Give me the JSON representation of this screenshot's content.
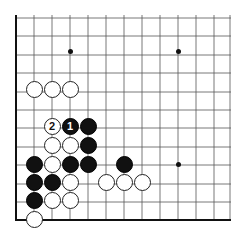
{
  "diagram": {
    "type": "go-board-corner",
    "colors": {
      "line": "#555555",
      "edge": "#111111",
      "black": "#111111",
      "white": "#ffffff"
    },
    "grid": {
      "x_lines": [
        16,
        34,
        52,
        70,
        88,
        106,
        124,
        142,
        160,
        178,
        196,
        214,
        230
      ],
      "y_lines": [
        18,
        36,
        55,
        73,
        92,
        110,
        128,
        147,
        165,
        184,
        202,
        220
      ],
      "left_edge_x": 16,
      "bottom_edge_y": 220,
      "top_y": 15,
      "right_x": 231
    },
    "star_points": [
      {
        "x": 70,
        "y": 51
      },
      {
        "x": 178,
        "y": 51
      },
      {
        "x": 178,
        "y": 164
      }
    ],
    "stones": [
      {
        "color": "white",
        "x": 34,
        "y": 89,
        "label": ""
      },
      {
        "color": "white",
        "x": 52,
        "y": 89,
        "label": ""
      },
      {
        "color": "white",
        "x": 70,
        "y": 89,
        "label": ""
      },
      {
        "color": "white",
        "x": 52,
        "y": 126,
        "label": "2"
      },
      {
        "color": "black",
        "x": 70,
        "y": 126,
        "label": "1"
      },
      {
        "color": "black",
        "x": 88,
        "y": 126,
        "label": ""
      },
      {
        "color": "white",
        "x": 52,
        "y": 145,
        "label": ""
      },
      {
        "color": "white",
        "x": 70,
        "y": 145,
        "label": ""
      },
      {
        "color": "black",
        "x": 88,
        "y": 145,
        "label": ""
      },
      {
        "color": "black",
        "x": 34,
        "y": 164,
        "label": ""
      },
      {
        "color": "white",
        "x": 52,
        "y": 164,
        "label": ""
      },
      {
        "color": "black",
        "x": 70,
        "y": 164,
        "label": ""
      },
      {
        "color": "black",
        "x": 88,
        "y": 164,
        "label": ""
      },
      {
        "color": "black",
        "x": 124,
        "y": 164,
        "label": ""
      },
      {
        "color": "black",
        "x": 34,
        "y": 182,
        "label": ""
      },
      {
        "color": "black",
        "x": 52,
        "y": 182,
        "label": ""
      },
      {
        "color": "white",
        "x": 70,
        "y": 182,
        "label": ""
      },
      {
        "color": "white",
        "x": 106,
        "y": 182,
        "label": ""
      },
      {
        "color": "white",
        "x": 124,
        "y": 182,
        "label": ""
      },
      {
        "color": "white",
        "x": 142,
        "y": 182,
        "label": ""
      },
      {
        "color": "black",
        "x": 34,
        "y": 200,
        "label": ""
      },
      {
        "color": "white",
        "x": 52,
        "y": 200,
        "label": ""
      },
      {
        "color": "white",
        "x": 70,
        "y": 200,
        "label": ""
      },
      {
        "color": "white",
        "x": 34,
        "y": 219,
        "label": ""
      }
    ]
  }
}
